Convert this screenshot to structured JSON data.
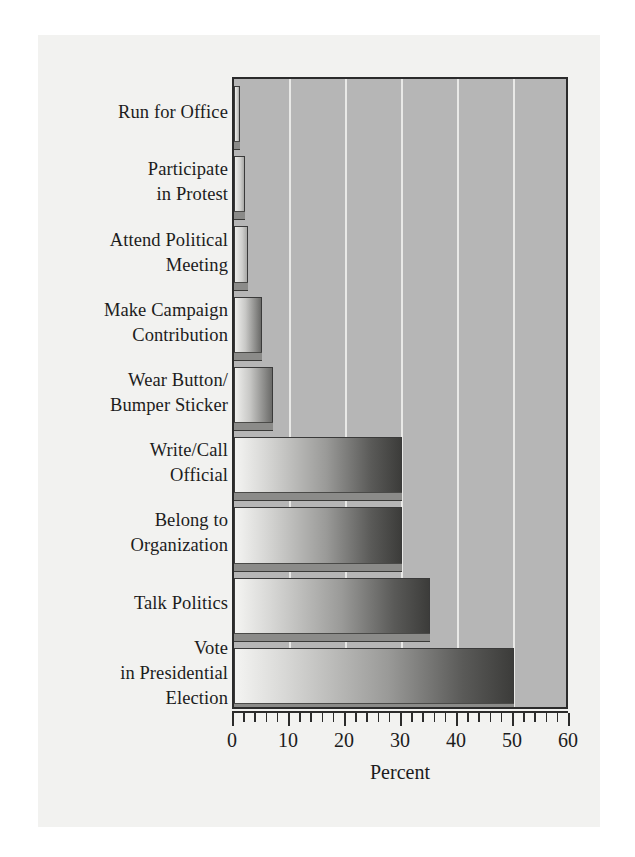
{
  "chart_data": {
    "type": "bar",
    "orientation": "horizontal",
    "title": "",
    "xlabel": "Percent",
    "ylabel": "",
    "xlim": [
      0,
      60
    ],
    "xticks": [
      0,
      10,
      20,
      30,
      40,
      50,
      60
    ],
    "xtick_labels": [
      "0",
      "10",
      "20",
      "30",
      "40",
      "50",
      "60"
    ],
    "minor_tick_step": 2,
    "grid": true,
    "grid_axis": "x",
    "gridlines_at": [
      10,
      20,
      30,
      40,
      50
    ],
    "legend": null,
    "categories": [
      "Run for Office",
      "Participate in Protest",
      "Attend Political Meeting",
      "Make Campaign Contribution",
      "Wear Button/ Bumper Sticker",
      "Write/Call Official",
      "Belong to Organization",
      "Talk Politics",
      "Vote in Presidential Election"
    ],
    "category_label_lines": [
      [
        "Run for Office"
      ],
      [
        "Participate",
        "in Protest"
      ],
      [
        "Attend Political",
        "Meeting"
      ],
      [
        "Make Campaign",
        "Contribution"
      ],
      [
        "Wear Button/",
        "Bumper Sticker"
      ],
      [
        "Write/Call",
        "Official"
      ],
      [
        "Belong to",
        "Organization"
      ],
      [
        "Talk Politics"
      ],
      [
        "Vote",
        "in Presidential",
        "Election"
      ]
    ],
    "values": [
      1,
      2,
      2.5,
      5,
      7,
      30,
      30,
      35,
      50
    ],
    "bar_colors": {
      "fill_light": "#f4f4f2",
      "fill_dark": "#3c3c3a",
      "outline": "#3a3a3a",
      "shadow": "#8b8b89"
    },
    "plot_background": "#b6b6b6",
    "page_background": "#f2f2f0",
    "axis_color": "#2b2b2b",
    "gridline_color": "#e9e9e7"
  },
  "xaxis": {
    "title": "Percent",
    "labels": [
      "0",
      "10",
      "20",
      "30",
      "40",
      "50",
      "60"
    ]
  },
  "bars": [
    {
      "label_lines": [
        "Run for Office"
      ],
      "value": 1
    },
    {
      "label_lines": [
        "Participate",
        "in Protest"
      ],
      "value": 2
    },
    {
      "label_lines": [
        "Attend Political",
        "Meeting"
      ],
      "value": 2.5
    },
    {
      "label_lines": [
        "Make Campaign",
        "Contribution"
      ],
      "value": 5
    },
    {
      "label_lines": [
        "Wear Button/",
        "Bumper Sticker"
      ],
      "value": 7
    },
    {
      "label_lines": [
        "Write/Call",
        "Official"
      ],
      "value": 30
    },
    {
      "label_lines": [
        "Belong to",
        "Organization"
      ],
      "value": 30
    },
    {
      "label_lines": [
        "Talk Politics"
      ],
      "value": 35
    },
    {
      "label_lines": [
        "Vote",
        "in Presidential",
        "Election"
      ],
      "value": 50
    }
  ]
}
